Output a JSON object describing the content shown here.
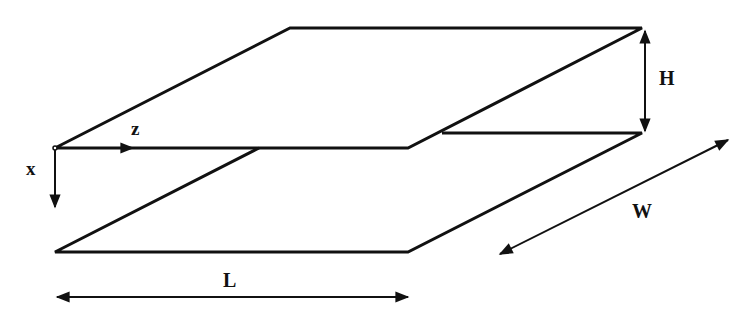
{
  "diagram": {
    "labels": {
      "z_axis": "z",
      "x_axis": "x",
      "height": "H",
      "width": "W",
      "length": "L"
    },
    "colors": {
      "stroke": "#111111",
      "background": "#ffffff"
    },
    "shapes": {
      "top_plate": [
        [
          55,
          148
        ],
        [
          290,
          28
        ],
        [
          642,
          28
        ],
        [
          408,
          148
        ]
      ],
      "bottom_plate": [
        [
          55,
          252
        ],
        [
          408,
          252
        ],
        [
          642,
          133
        ],
        [
          442,
          133
        ]
      ],
      "h_arrow": [
        [
          645,
          30
        ],
        [
          645,
          132
        ]
      ],
      "w_arrow": [
        [
          500,
          254
        ],
        [
          728,
          140
        ]
      ],
      "l_arrow": [
        [
          57,
          297
        ],
        [
          408,
          297
        ]
      ],
      "origin": [
        55,
        148
      ]
    }
  }
}
